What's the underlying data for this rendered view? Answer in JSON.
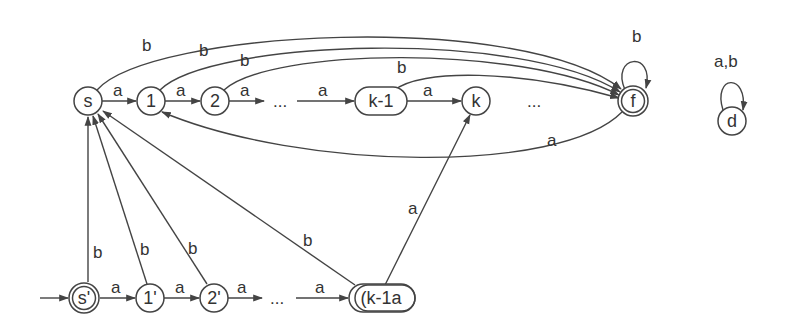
{
  "diagram": {
    "type": "finite-automaton",
    "nodes": [
      {
        "id": "s",
        "label": "s",
        "x": 88,
        "y": 101,
        "shape": "circle",
        "accepting": false
      },
      {
        "id": "1",
        "label": "1",
        "x": 151,
        "y": 101,
        "shape": "circle",
        "accepting": false
      },
      {
        "id": "2",
        "label": "2",
        "x": 215,
        "y": 101,
        "shape": "circle",
        "accepting": false
      },
      {
        "id": "k-1",
        "label": "k-1",
        "x": 381,
        "y": 101,
        "shape": "pill",
        "accepting": false
      },
      {
        "id": "k",
        "label": "k",
        "x": 476,
        "y": 101,
        "shape": "circle",
        "accepting": false
      },
      {
        "id": "f",
        "label": "f",
        "x": 633,
        "y": 101,
        "shape": "circle",
        "accepting": true
      },
      {
        "id": "d",
        "label": "d",
        "x": 732,
        "y": 121,
        "shape": "circle",
        "accepting": false
      },
      {
        "id": "s'",
        "label": "s'",
        "x": 84,
        "y": 298,
        "shape": "circle",
        "accepting": true,
        "initial": true
      },
      {
        "id": "1'",
        "label": "1'",
        "x": 150,
        "y": 298,
        "shape": "circle",
        "accepting": false
      },
      {
        "id": "2'",
        "label": "2'",
        "x": 214,
        "y": 298,
        "shape": "circle",
        "accepting": false
      },
      {
        "id": "(k-1)a",
        "label": "(k-1a",
        "x": 382,
        "y": 298,
        "shape": "pill",
        "accepting": false
      }
    ],
    "ellipses": [
      {
        "label": "...",
        "x": 283,
        "y": 106
      },
      {
        "label": "...",
        "x": 537,
        "y": 106
      },
      {
        "label": "...",
        "x": 280,
        "y": 303
      }
    ],
    "edges": [
      {
        "from": "s",
        "to": "1",
        "label": "a"
      },
      {
        "from": "1",
        "to": "2",
        "label": "a"
      },
      {
        "from": "2",
        "to": "...",
        "label": "a"
      },
      {
        "from": "...",
        "to": "k-1",
        "label": "a"
      },
      {
        "from": "k-1",
        "to": "k",
        "label": "a"
      },
      {
        "from": "s",
        "to": "f",
        "label": "b"
      },
      {
        "from": "1",
        "to": "f",
        "label": "b"
      },
      {
        "from": "2",
        "to": "f",
        "label": "b"
      },
      {
        "from": "k-1",
        "to": "f",
        "label": "b"
      },
      {
        "from": "f",
        "to": "f",
        "label": "b"
      },
      {
        "from": "f",
        "to": "1",
        "label": "a"
      },
      {
        "from": "d",
        "to": "d",
        "label": "a,b"
      },
      {
        "from": "s'",
        "to": "1'",
        "label": "a"
      },
      {
        "from": "1'",
        "to": "2'",
        "label": "a"
      },
      {
        "from": "2'",
        "to": "...",
        "label": "a"
      },
      {
        "from": "...",
        "to": "(k-1)a",
        "label": "a"
      },
      {
        "from": "s'",
        "to": "s",
        "label": "b"
      },
      {
        "from": "1'",
        "to": "s",
        "label": "b"
      },
      {
        "from": "2'",
        "to": "s",
        "label": "b"
      },
      {
        "from": "(k-1)a",
        "to": "s",
        "label": "b"
      },
      {
        "from": "(k-1)a",
        "to": "k",
        "label": "a"
      }
    ],
    "labels": {
      "a": "a",
      "b": "b",
      "ab": "a,b",
      "dots": "..."
    }
  }
}
